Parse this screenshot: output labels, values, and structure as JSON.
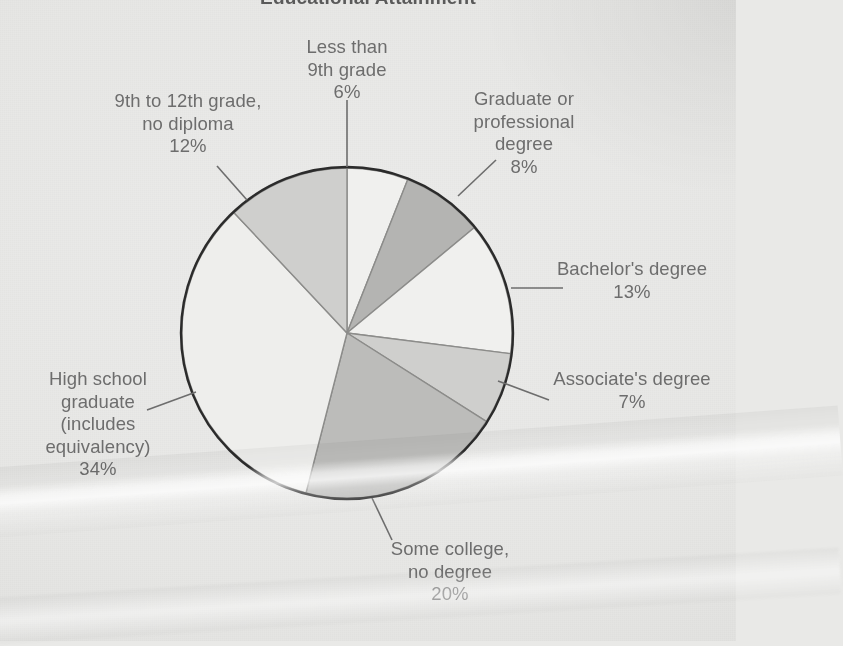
{
  "chart": {
    "title": "Educational Attainment",
    "type_label": "pie-chart"
  },
  "labels": {
    "less_than_9th": "Less than\n9th grade\n6%",
    "grade_9_to_12": "9th to 12th grade,\nno diploma\n12%",
    "graduate_professional": "Graduate or\nprofessional\ndegree\n8%",
    "bachelors": "Bachelor's degree\n13%",
    "associates": "Associate's degree\n7%",
    "some_college": "Some college,\nno degree\n20%",
    "high_school": "High school\ngraduate\n(includes\nequivalency)\n34%"
  },
  "chart_data": {
    "type": "pie",
    "title": "Educational Attainment",
    "subtitle": "",
    "xlabel": "",
    "ylabel": "",
    "units": "percent",
    "total": 100,
    "start_angle_deg": 0,
    "direction": "clockwise",
    "legend": "none (direct labels with leader lines)",
    "grid": false,
    "categories": [
      "Less than 9th grade",
      "Graduate or professional degree",
      "Bachelor's degree",
      "Associate's degree",
      "Some college, no degree",
      "High school graduate (includes equivalency)",
      "9th to 12th grade, no diploma"
    ],
    "values": [
      6,
      8,
      13,
      7,
      20,
      34,
      12
    ],
    "slices": [
      {
        "label": "Less than 9th grade",
        "value": 6,
        "display": "6%",
        "color": "#f0f0ee"
      },
      {
        "label": "Graduate or professional degree",
        "value": 8,
        "display": "8%",
        "color": "#b4b4b2"
      },
      {
        "label": "Bachelor's degree",
        "value": 13,
        "display": "13%",
        "color": "#f0f0ee"
      },
      {
        "label": "Associate's degree",
        "value": 7,
        "display": "7%",
        "color": "#cfcfcd"
      },
      {
        "label": "Some college, no degree",
        "value": 20,
        "display": "20%",
        "color": "#bcbcba"
      },
      {
        "label": "High school graduate (includes equivalency)",
        "value": 34,
        "display": "34%",
        "color": "#eeeeec"
      },
      {
        "label": "9th to 12th grade, no diploma",
        "value": 12,
        "display": "12%",
        "color": "#cfcfcd"
      }
    ]
  },
  "colors": {
    "text": "#6d6d6d",
    "title": "#5a5a5a",
    "outline": "#2b2b2b",
    "paper": "#e9e9e7",
    "leader_line": "#6d6d6d"
  }
}
